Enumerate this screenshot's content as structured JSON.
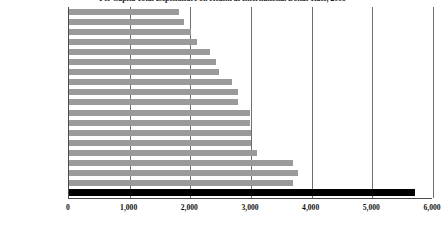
{
  "chart_data": {
    "type": "bar",
    "orientation": "horizontal",
    "title": "Per Capita Total Expenditure on Health at International Dollar Rate, 2009",
    "xlabel": "",
    "ylabel": "",
    "xlim": [
      0,
      6000
    ],
    "xticks": [
      0,
      1000,
      2000,
      3000,
      4000,
      5000,
      6000
    ],
    "xtick_labels": [
      "0",
      "1,000",
      "2,000",
      "3,000",
      "4,000",
      "5,000",
      "6,000"
    ],
    "grid": true,
    "grid_axis": "x",
    "legend": false,
    "bar_color": "#9a9a9a",
    "highlight_color": "#000000",
    "highlight_category": "United States",
    "categories": [
      "Portugal",
      "Spain",
      "Greece",
      "Finland",
      "Italy",
      "Austria",
      "United Kingdom",
      "Ireland",
      "Sweden",
      "Denmark",
      "Belgium",
      "France",
      "Netherlands",
      "Germany",
      "Iceland",
      "Luxembourg",
      "Switzerland",
      "Norway",
      "United States"
    ],
    "values": [
      1820,
      1900,
      2010,
      2110,
      2320,
      2430,
      2480,
      2680,
      2780,
      2790,
      2980,
      2990,
      3000,
      3000,
      3100,
      3700,
      3780,
      3700,
      5700
    ]
  }
}
